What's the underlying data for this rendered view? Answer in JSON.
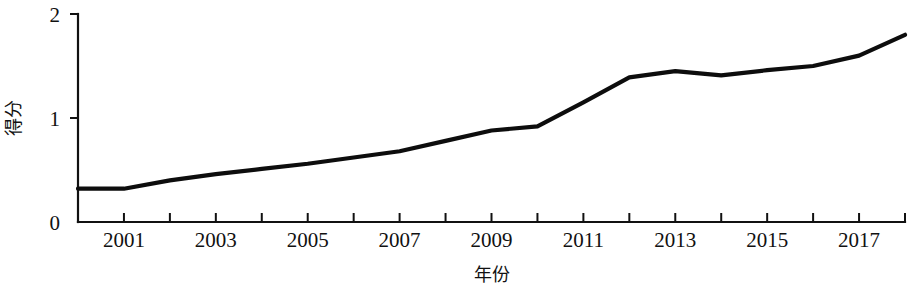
{
  "chart_data": {
    "type": "line",
    "title": "",
    "xlabel": "年份",
    "ylabel": "得分",
    "xlim": [
      2000,
      2018
    ],
    "ylim": [
      0,
      2
    ],
    "grid": false,
    "legend": false,
    "y_ticks": [
      "0",
      "1",
      "2"
    ],
    "y_tick_values": [
      0,
      1,
      2
    ],
    "x_tick_values": [
      2000,
      2001,
      2002,
      2003,
      2004,
      2005,
      2006,
      2007,
      2008,
      2009,
      2010,
      2011,
      2012,
      2013,
      2014,
      2015,
      2016,
      2017,
      2018
    ],
    "x_tick_labels": [
      "",
      "2001",
      "",
      "2003",
      "",
      "2005",
      "",
      "2007",
      "",
      "2009",
      "",
      "2011",
      "",
      "2013",
      "",
      "2015",
      "",
      "2017",
      ""
    ],
    "x": [
      2000,
      2001,
      2002,
      2003,
      2004,
      2005,
      2006,
      2007,
      2008,
      2009,
      2010,
      2011,
      2012,
      2013,
      2014,
      2015,
      2016,
      2017,
      2018
    ],
    "values": [
      0.32,
      0.32,
      0.4,
      0.46,
      0.51,
      0.56,
      0.62,
      0.68,
      0.78,
      0.88,
      0.92,
      1.15,
      1.39,
      1.45,
      1.41,
      1.46,
      1.5,
      1.6,
      1.8
    ],
    "series": [
      {
        "name": "得分",
        "color": "#0d0d0d",
        "values": [
          0.32,
          0.32,
          0.4,
          0.46,
          0.51,
          0.56,
          0.62,
          0.68,
          0.78,
          0.88,
          0.92,
          1.15,
          1.39,
          1.45,
          1.41,
          1.46,
          1.5,
          1.6,
          1.8
        ]
      }
    ]
  },
  "style": {
    "axis_color": "#111111",
    "line_color": "#0d0d0d",
    "background": "#ffffff"
  }
}
